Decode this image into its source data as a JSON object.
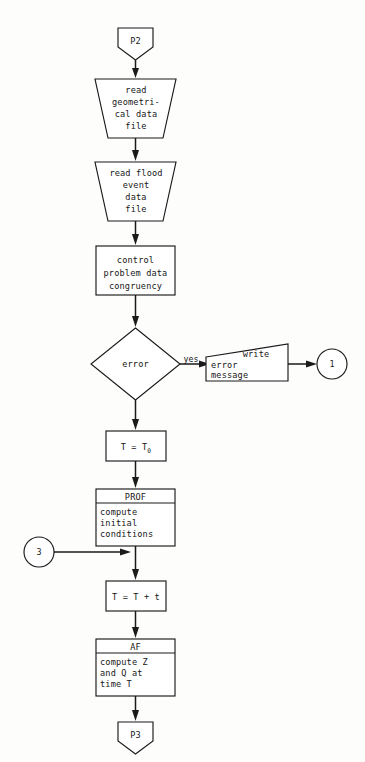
{
  "diagram": {
    "colors": {
      "background": "#fdfdfc",
      "stroke": "#1a1a1a",
      "fill": "#ffffff",
      "text": "#171717"
    },
    "nodes": [
      {
        "id": "start-p2",
        "shape": "pentagon-down",
        "label": "P2"
      },
      {
        "id": "read-geometrical",
        "shape": "trapezoid",
        "lines": [
          "read",
          "geometri-",
          "cal data",
          "file"
        ]
      },
      {
        "id": "read-flood",
        "shape": "trapezoid",
        "lines": [
          "read flood",
          "event",
          "data",
          "file"
        ]
      },
      {
        "id": "control-congruency",
        "shape": "rectangle",
        "lines": [
          "control",
          "problem data",
          "congruency"
        ]
      },
      {
        "id": "error-decision",
        "shape": "diamond",
        "label": "error"
      },
      {
        "id": "write-error-message",
        "shape": "slanted-top-trapezoid",
        "lines": [
          "write",
          "error",
          "message"
        ]
      },
      {
        "id": "connector-1",
        "shape": "circle",
        "label": "1"
      },
      {
        "id": "set-t-t0",
        "shape": "rectangle",
        "label": "T = T",
        "subscript": "0"
      },
      {
        "id": "prof-subroutine",
        "shape": "predefined-process",
        "header": "PROF",
        "lines": [
          "compute",
          "initial",
          "conditions"
        ]
      },
      {
        "id": "connector-3",
        "shape": "circle",
        "label": "3"
      },
      {
        "id": "increment-t",
        "shape": "rectangle",
        "label": "T = T + t"
      },
      {
        "id": "af-subroutine",
        "shape": "predefined-process",
        "header": "AF",
        "lines": [
          "compute Z",
          "and Q at",
          "time T"
        ]
      },
      {
        "id": "end-p3",
        "shape": "pentagon-down",
        "label": "P3"
      }
    ],
    "edges": [
      {
        "from": "start-p2",
        "to": "read-geometrical",
        "label": ""
      },
      {
        "from": "read-geometrical",
        "to": "read-flood",
        "label": ""
      },
      {
        "from": "read-flood",
        "to": "control-congruency",
        "label": ""
      },
      {
        "from": "control-congruency",
        "to": "error-decision",
        "label": ""
      },
      {
        "from": "error-decision",
        "to": "write-error-message",
        "label": "yes"
      },
      {
        "from": "write-error-message",
        "to": "connector-1",
        "label": ""
      },
      {
        "from": "error-decision",
        "to": "set-t-t0",
        "label": ""
      },
      {
        "from": "set-t-t0",
        "to": "prof-subroutine",
        "label": ""
      },
      {
        "from": "prof-subroutine",
        "to": "increment-t",
        "label": ""
      },
      {
        "from": "connector-3",
        "to": "increment-t",
        "label": ""
      },
      {
        "from": "increment-t",
        "to": "af-subroutine",
        "label": ""
      },
      {
        "from": "af-subroutine",
        "to": "end-p3",
        "label": ""
      }
    ],
    "text": {
      "p2": "P2",
      "geo_l1": "read",
      "geo_l2": "geometri-",
      "geo_l3": "cal data",
      "geo_l4": "file",
      "flood_l1": "read flood",
      "flood_l2": "event",
      "flood_l3": "data",
      "flood_l4": "file",
      "ctrl_l1": "control",
      "ctrl_l2": "problem data",
      "ctrl_l3": "congruency",
      "error": "error",
      "yes": "yes",
      "write": "write",
      "err_l1": "error",
      "err_l2": "message",
      "conn_one": "1",
      "t_eq_t0_main": "T = T",
      "t_eq_t0_sub": "0",
      "prof_header": "PROF",
      "prof_l1": "compute",
      "prof_l2": "initial",
      "prof_l3": "conditions",
      "conn_three": "3",
      "t_plus_t": "T = T + t",
      "af_header": "AF",
      "af_l1": "compute Z",
      "af_l2": "and Q at",
      "af_l3": "time T",
      "p3": "P3"
    }
  }
}
